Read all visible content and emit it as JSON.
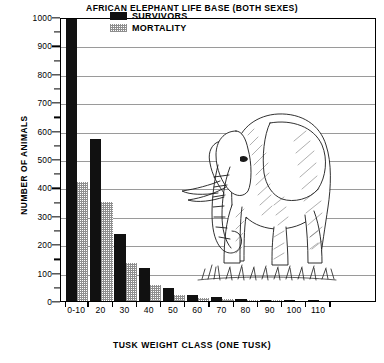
{
  "chart_data": {
    "type": "bar",
    "title": "AFRICAN ELEPHANT LIFE BASE  (BOTH SEXES)",
    "xlabel": "TUSK WEIGHT CLASS (ONE TUSK)",
    "ylabel": "NUMBER OF ANIMALS",
    "ylim": [
      0,
      1000
    ],
    "ytick_labels": [
      "0",
      "100",
      "200",
      "300",
      "400",
      "500",
      "600",
      "700",
      "800",
      "900",
      "1000"
    ],
    "ytick_values": [
      0,
      100,
      200,
      300,
      400,
      500,
      600,
      700,
      800,
      900,
      1000
    ],
    "yminor_values": [
      50,
      150,
      250,
      350,
      450,
      550,
      650,
      750,
      850,
      950
    ],
    "grid": true,
    "legend_position": "top-center",
    "categories": [
      "0-10",
      "20",
      "30",
      "40",
      "50",
      "60",
      "70",
      "80",
      "90",
      "100",
      "110"
    ],
    "series": [
      {
        "name": "SURVIVORS",
        "color": "#111111",
        "values": [
          1000,
          570,
          235,
          115,
          45,
          22,
          14,
          8,
          4,
          2,
          1
        ]
      },
      {
        "name": "MORTALITY",
        "color": "#8e8e8e",
        "values": [
          420,
          350,
          135,
          55,
          22,
          12,
          7,
          4,
          2,
          1,
          0
        ]
      }
    ],
    "annotations": [
      {
        "name": "elephant-illustration",
        "description": "Line drawing of an adult African elephant standing on grass"
      }
    ]
  },
  "legend": {
    "entries": [
      {
        "label": "SURVIVORS",
        "swatch": "solid-black-swatch"
      },
      {
        "label": "MORTALITY",
        "swatch": "stippled-gray-swatch"
      }
    ]
  }
}
